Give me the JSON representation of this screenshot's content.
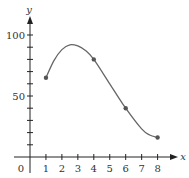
{
  "chart_data": {
    "type": "line",
    "title": "",
    "xlabel": "x",
    "ylabel": "y",
    "x_ticks": [
      1,
      2,
      3,
      4,
      5,
      6,
      7,
      8
    ],
    "x_tick_labels": [
      "1",
      "2",
      "3",
      "4",
      "5",
      "6",
      "7",
      "8"
    ],
    "y_tick_labels": [
      {
        "value": 50,
        "label": "50"
      },
      {
        "value": 100,
        "label": "100"
      }
    ],
    "y_minor_ticks": [
      10,
      20,
      30,
      40,
      50,
      60,
      70,
      80,
      90,
      100
    ],
    "origin_label": "0",
    "xlim": [
      0,
      8.8
    ],
    "ylim": [
      0,
      112
    ],
    "grid": false,
    "series": [
      {
        "name": "curve",
        "marked_points": [
          {
            "x": 1,
            "y": 65
          },
          {
            "x": 4,
            "y": 80
          },
          {
            "x": 6,
            "y": 40
          },
          {
            "x": 8,
            "y": 16
          }
        ],
        "curve_points": [
          {
            "x": 1,
            "y": 65
          },
          {
            "x": 1.5,
            "y": 79
          },
          {
            "x": 2,
            "y": 88
          },
          {
            "x": 2.5,
            "y": 92
          },
          {
            "x": 3,
            "y": 91
          },
          {
            "x": 3.5,
            "y": 87
          },
          {
            "x": 4,
            "y": 80
          },
          {
            "x": 5,
            "y": 60
          },
          {
            "x": 6,
            "y": 40
          },
          {
            "x": 7,
            "y": 23
          },
          {
            "x": 7.5,
            "y": 18
          },
          {
            "x": 8,
            "y": 16
          }
        ]
      }
    ]
  },
  "colors": {
    "axis": "#222222",
    "curve": "#666666",
    "point": "#555555",
    "text": "#333333"
  }
}
